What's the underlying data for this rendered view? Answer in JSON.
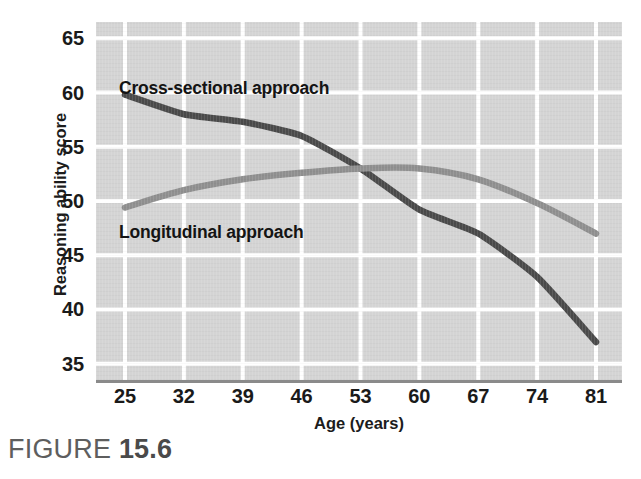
{
  "figure": {
    "caption_word": "FIGURE",
    "caption_number": "15.6"
  },
  "chart_data": {
    "type": "line",
    "title": "",
    "subtitle": "",
    "xlabel": "Age (years)",
    "ylabel": "Reasoning ability score",
    "x": [
      25,
      32,
      39,
      46,
      53,
      60,
      67,
      74,
      81
    ],
    "xticklabels": [
      "25",
      "32",
      "39",
      "46",
      "53",
      "60",
      "67",
      "74",
      "81"
    ],
    "yticks": [
      65,
      60,
      55,
      50,
      45,
      40,
      35
    ],
    "yticklabels": [
      "65",
      "60",
      "55",
      "50",
      "45",
      "40",
      "35"
    ],
    "xlim": [
      25,
      81
    ],
    "ylim": [
      33.5,
      66.5
    ],
    "grid": true,
    "grid_color": "#ffffff",
    "plot_background": "#d4d4d4",
    "legend_position": "in-plot annotations",
    "series": [
      {
        "name": "Cross-sectional approach",
        "color": "#4a4a4a",
        "values": [
          59.8,
          58.0,
          57.3,
          56.0,
          53.0,
          49.2,
          47.0,
          43.0,
          37.0
        ]
      },
      {
        "name": "Longitudinal approach",
        "color": "#8f8f8f",
        "values": [
          49.4,
          51.0,
          52.0,
          52.6,
          53.0,
          53.0,
          52.0,
          49.8,
          47.0
        ]
      }
    ],
    "annotations": [
      {
        "text": "Cross-sectional approach",
        "series": "Cross-sectional approach"
      },
      {
        "text": "Longitudinal approach",
        "series": "Longitudinal approach"
      }
    ]
  }
}
